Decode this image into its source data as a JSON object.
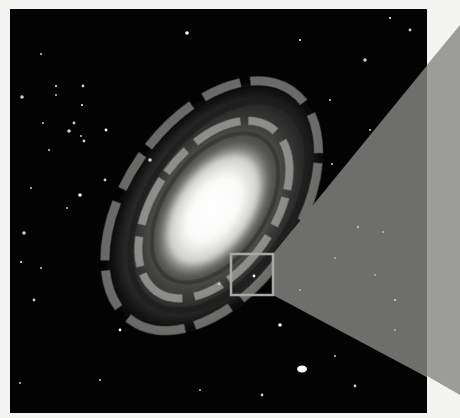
{
  "image": {
    "subject": "spiral galaxy photograph with zoom-inset indicator",
    "background_color": "#f4f4f2",
    "frame": {
      "x": 10,
      "y": 9,
      "width": 417,
      "height": 404,
      "color": "#030303"
    },
    "galaxy": {
      "center_x": 215,
      "center_y": 208,
      "core_rx": 34,
      "core_ry": 58,
      "rotation_deg": 35,
      "disk_rx": 105,
      "disk_ry": 150
    },
    "highlight_box": {
      "x": 231,
      "y": 254,
      "width": 42,
      "height": 41,
      "stroke": "#a9a9a2"
    },
    "projection_cone": {
      "inner_color": "#6e6e6c",
      "outer_color": "#9c9c98",
      "points": "273,254 460,25 460,395 273,295"
    },
    "stars": [
      [
        187,
        33
      ],
      [
        41,
        54
      ],
      [
        43,
        123
      ],
      [
        83,
        86
      ],
      [
        56,
        86
      ],
      [
        22,
        97
      ],
      [
        84,
        141
      ],
      [
        56,
        95
      ],
      [
        82,
        105
      ],
      [
        74,
        123
      ],
      [
        69,
        131
      ],
      [
        81,
        136
      ],
      [
        106,
        130
      ],
      [
        49,
        150
      ],
      [
        31,
        188
      ],
      [
        24,
        233
      ],
      [
        21,
        262
      ],
      [
        41,
        268
      ],
      [
        34,
        300
      ],
      [
        67,
        208
      ],
      [
        80,
        195
      ],
      [
        105,
        180
      ],
      [
        332,
        164
      ],
      [
        219,
        284
      ],
      [
        254,
        276
      ],
      [
        302,
        369
      ],
      [
        335,
        356
      ],
      [
        262,
        395
      ],
      [
        300,
        40
      ],
      [
        330,
        100
      ],
      [
        365,
        60
      ],
      [
        370,
        130
      ],
      [
        390,
        18
      ],
      [
        410,
        30
      ],
      [
        20,
        383
      ],
      [
        150,
        160
      ],
      [
        120,
        330
      ],
      [
        100,
        380
      ],
      [
        200,
        390
      ],
      [
        355,
        386
      ],
      [
        280,
        325
      ],
      [
        395,
        300
      ]
    ]
  }
}
